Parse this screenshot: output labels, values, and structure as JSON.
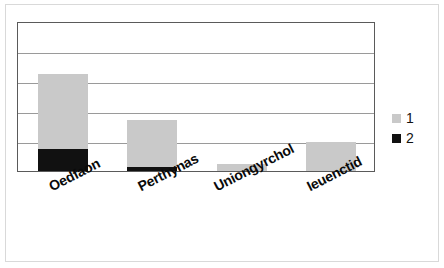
{
  "chart_data": {
    "type": "bar",
    "subtype": "stacked-vertical",
    "title": "",
    "subtitle": "",
    "xlabel": "",
    "ylabel": "",
    "categories": [
      "Oedfaon",
      "Perthynas",
      "Uniongyrchol",
      "Ieuenctid"
    ],
    "series": [
      {
        "name": "1",
        "color": "#c9c9c9",
        "values": [
          2.5,
          1.55,
          0.23,
          0.97
        ]
      },
      {
        "name": "2",
        "color": "#111111",
        "values": [
          0.73,
          0.15,
          0.0,
          0.0
        ]
      }
    ],
    "totals": [
      3.23,
      1.7,
      0.23,
      0.97
    ],
    "ylim": [
      0,
      5
    ],
    "yticks": [
      0,
      1,
      2,
      3,
      4,
      5
    ],
    "ytick_labels": [
      "",
      "",
      "",
      "",
      "",
      ""
    ],
    "gridlines": 6,
    "grid": true,
    "grid_axis": "y",
    "legend_position": "right",
    "legend_entries": [
      "1",
      "2"
    ],
    "plot_border_color": "#5a5a5a",
    "gridline_color": "#9a9a9a",
    "background_color": "#ffffff",
    "xtick_label_rotation": -27
  },
  "legend": {
    "items": [
      {
        "label": "1",
        "swatch": "gray-swatch"
      },
      {
        "label": "2",
        "swatch": "black-swatch"
      }
    ]
  },
  "axis": {
    "categories": [
      {
        "label": "Oedfaon"
      },
      {
        "label": "Perthynas"
      },
      {
        "label": "Uniongyrchol"
      },
      {
        "label": "Ieuenctid"
      }
    ]
  }
}
